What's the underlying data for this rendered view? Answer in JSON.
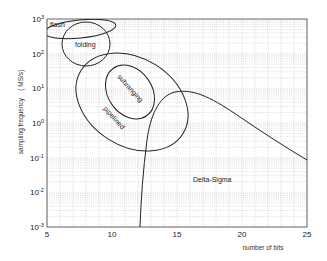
{
  "chart_data": {
    "type": "line",
    "title": "",
    "xlabel": "number of bits",
    "ylabel": "sampling frequency    ( MS/s)",
    "xlim": [
      5,
      25
    ],
    "ylim": [
      0.001,
      1000
    ],
    "yscale": "log",
    "grid": true,
    "x_ticks": [
      "5",
      "10",
      "15",
      "20",
      "25"
    ],
    "y_ticks": [
      {
        "base": "10",
        "exp": "3"
      },
      {
        "base": "10",
        "exp": "2"
      },
      {
        "base": "10",
        "exp": "1"
      },
      {
        "base": "10",
        "exp": "0"
      },
      {
        "base": "10",
        "exp": "-1"
      },
      {
        "base": "10",
        "exp": "-2"
      },
      {
        "base": "10",
        "exp": "-3"
      }
    ],
    "regions": [
      {
        "name": "flash",
        "shape": "ellipse",
        "bits_range": [
          4,
          11
        ],
        "freq_range_MSps": [
          250,
          1000
        ],
        "label_pos": {
          "bits": 5.6,
          "freq": 700
        }
      },
      {
        "name": "folding",
        "shape": "ellipse",
        "bits_range": [
          6.1,
          9.8
        ],
        "freq_range_MSps": [
          20,
          800
        ],
        "label_pos": {
          "bits": 7.5,
          "freq": 130
        }
      },
      {
        "name": "subranging",
        "shape": "ellipse",
        "bits_range": [
          9.2,
          13.5
        ],
        "freq_range_MSps": [
          0.5,
          80
        ],
        "label_pos": {
          "bits": 11.3,
          "freq": 8
        }
      },
      {
        "name": "pipelined",
        "shape": "ellipse",
        "bits_range": [
          7.2,
          16.2
        ],
        "freq_range_MSps": [
          0.08,
          100
        ],
        "label_pos": {
          "bits": 10,
          "freq": 0.6
        }
      }
    ],
    "series": [
      {
        "name": "Delta-Sigma",
        "x": [
          11.4,
          11.6,
          11.9,
          12.3,
          12.8,
          13.5,
          14.3,
          15.0,
          16.0,
          17.5,
          19.0,
          20.5,
          22.0,
          23.5,
          25.0
        ],
        "y": [
          0.001,
          0.01,
          0.08,
          0.3,
          1.0,
          3.5,
          7,
          9,
          8,
          5,
          3,
          1.6,
          0.8,
          0.35,
          0.1
        ],
        "label_pos": {
          "bits": 16.1,
          "freq": 0.018
        }
      }
    ]
  }
}
